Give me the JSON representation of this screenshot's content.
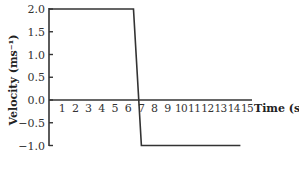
{
  "chart_data": {
    "type": "line",
    "title": "",
    "xlabel": "Time (s)",
    "ylabel": "Velocity (ms⁻¹)",
    "xlim": [
      0,
      15
    ],
    "ylim": [
      -1.0,
      2.0
    ],
    "x_ticks": [
      1,
      2,
      3,
      4,
      5,
      6,
      7,
      8,
      9,
      10,
      11,
      12,
      13,
      14,
      15
    ],
    "y_ticks": [
      "2.0",
      "1.5",
      "1.0",
      "0.5",
      "0.0",
      "−0.5",
      "−1.0"
    ],
    "grid": false,
    "series": [
      {
        "name": "velocity",
        "points": [
          [
            0,
            2.0
          ],
          [
            6.4,
            2.0
          ],
          [
            7.0,
            -1.0
          ],
          [
            14.5,
            -1.0
          ]
        ]
      }
    ]
  }
}
